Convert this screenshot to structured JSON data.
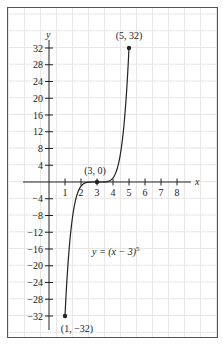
{
  "chart_data": {
    "type": "line",
    "title": "",
    "xlabel": "x",
    "ylabel": "y",
    "function": "y = (x - 3)^5",
    "equation_label": "y = (x − 3)",
    "equation_exponent": "5",
    "xlim": [
      0,
      8.5
    ],
    "ylim": [
      -34,
      35
    ],
    "x_ticks": [
      1,
      2,
      3,
      4,
      5,
      6,
      7,
      8
    ],
    "x_tick_labels": [
      "1",
      "2",
      "3",
      "4",
      "5",
      "6",
      "7",
      "8"
    ],
    "y_ticks": [
      32,
      28,
      24,
      20,
      16,
      12,
      8,
      4,
      -4,
      -8,
      -12,
      -16,
      -20,
      -24,
      -28,
      -32
    ],
    "y_tick_labels": [
      "32",
      "28",
      "24",
      "20",
      "16",
      "12",
      "8",
      "4",
      "−4",
      "−8",
      "−12",
      "−16",
      "−20",
      "−24",
      "−28",
      "−32"
    ],
    "domain": [
      1,
      5
    ],
    "grid": true,
    "legend": "none",
    "points": [
      {
        "x": 1,
        "y": -32,
        "label": "(1, −32)"
      },
      {
        "x": 3,
        "y": 0,
        "label": "(3, 0)"
      },
      {
        "x": 5,
        "y": 32,
        "label": "(5, 32)"
      }
    ],
    "colors": {
      "curve": "#222222",
      "grid": "#e6e6e6",
      "frame": "#555555",
      "axis": "#222222"
    }
  }
}
